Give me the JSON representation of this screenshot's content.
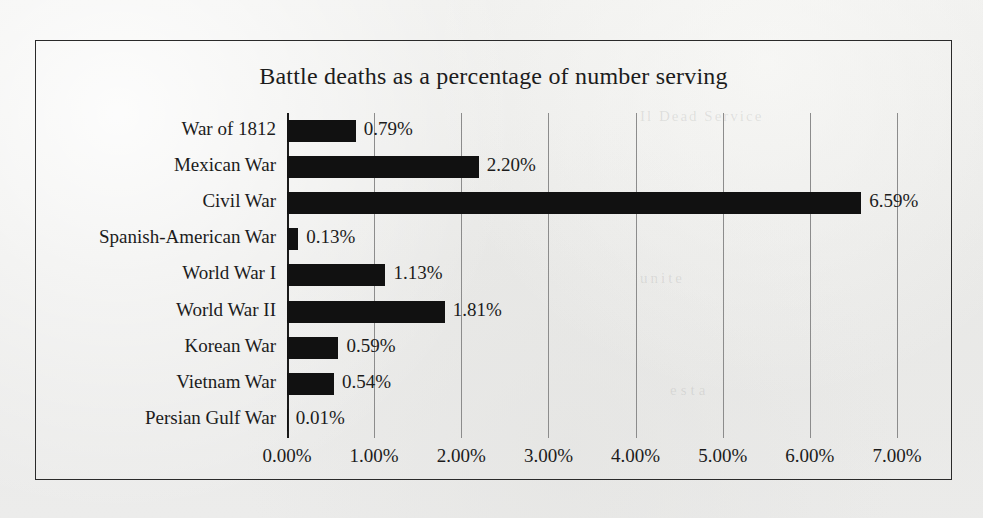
{
  "chart_data": {
    "type": "bar",
    "orientation": "horizontal",
    "title": "Battle deaths as a percentage of number serving",
    "xlabel": "",
    "ylabel": "",
    "xlim": [
      0,
      7
    ],
    "xtick_labels": [
      "0.00%",
      "1.00%",
      "2.00%",
      "3.00%",
      "4.00%",
      "5.00%",
      "6.00%",
      "7.00%"
    ],
    "xtick_values": [
      0,
      1,
      2,
      3,
      4,
      5,
      6,
      7
    ],
    "grid": "vertical",
    "legend": "none",
    "categories": [
      "War of 1812",
      "Mexican War",
      "Civil War",
      "Spanish-American War",
      "World War I",
      "World War II",
      "Korean War",
      "Vietnam War",
      "Persian Gulf War"
    ],
    "values": [
      0.79,
      2.2,
      6.59,
      0.13,
      1.13,
      1.81,
      0.59,
      0.54,
      0.01
    ],
    "value_labels": [
      "0.79%",
      "2.20%",
      "6.59%",
      "0.13%",
      "1.13%",
      "1.81%",
      "0.59%",
      "0.54%",
      "0.01%"
    ],
    "bar_color": "#111111",
    "gridline_color": "#8c8c8c",
    "background_color": "#eeeeec"
  },
  "bleed_through": {
    "line1": "Il Dead   Service",
    "line2": "unite",
    "line3": "esta"
  }
}
